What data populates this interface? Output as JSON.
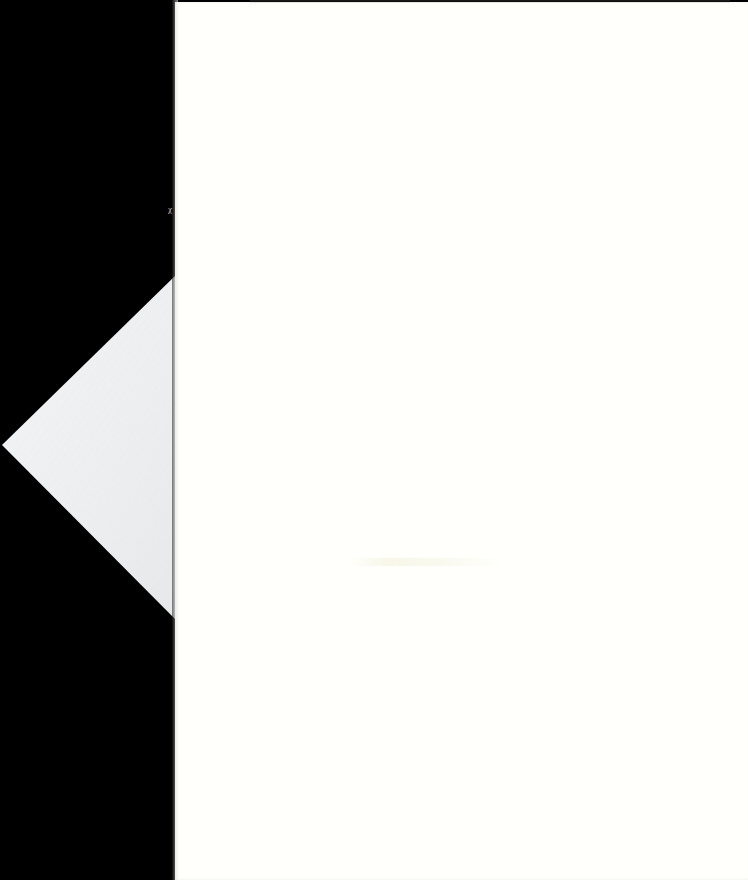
{
  "document": {
    "type": "scanned-blank-page",
    "background_color": "#000000",
    "page_color": "#fffffb",
    "folded_corner_color": "#eef0f2",
    "page_text": "",
    "edge_mark": "ᵪ"
  }
}
